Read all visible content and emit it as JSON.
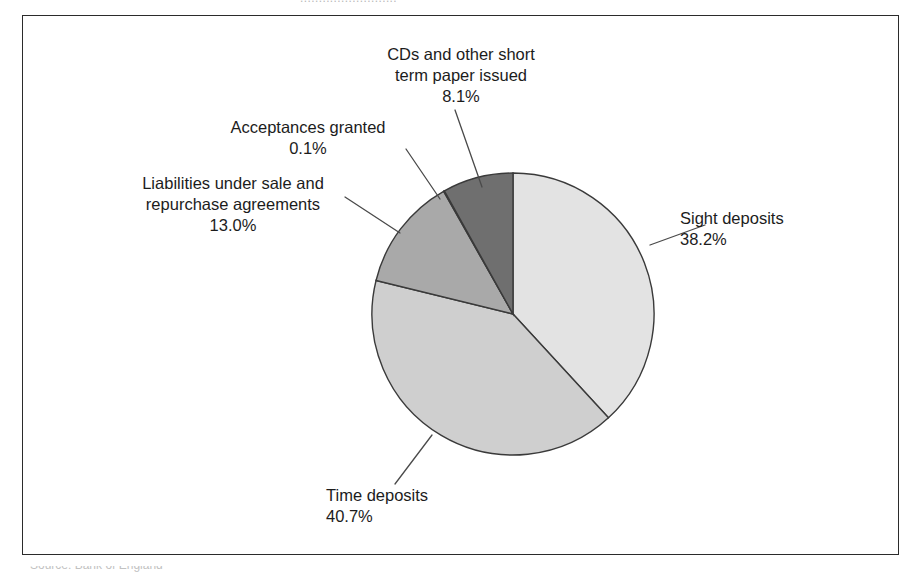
{
  "figure": {
    "top_clipped_caption": "..........................",
    "bottom_clipped_caption": "Source: Bank of England"
  },
  "chart_data": {
    "type": "pie",
    "title": "",
    "subtitle": "",
    "xlabel": "",
    "ylabel": "",
    "legend_position": "callout-labels",
    "grid": false,
    "units": "percent",
    "total": 100.1,
    "start_angle_deg": 0,
    "direction": "clockwise",
    "categories": [
      "Sight deposits",
      "Time deposits",
      "Liabilities under sale and repurchase agreements",
      "Acceptances granted",
      "CDs and other short term paper issued"
    ],
    "values": [
      38.2,
      40.7,
      13.0,
      0.1,
      8.1
    ],
    "value_labels": [
      "38.2%",
      "40.7%",
      "13.0%",
      "0.1%",
      "8.1%"
    ],
    "colors": [
      "#e3e3e3",
      "#cfcfcf",
      "#a9a9a9",
      "#bdbdbd",
      "#6f6f6f"
    ],
    "slices": [
      {
        "name": "Sight deposits",
        "value": 38.2,
        "value_label": "38.2%",
        "color": "#e3e3e3",
        "label_lines": [
          "Sight deposits",
          "38.2%"
        ]
      },
      {
        "name": "Time deposits",
        "value": 40.7,
        "value_label": "40.7%",
        "color": "#cfcfcf",
        "label_lines": [
          "Time deposits",
          "40.7%"
        ]
      },
      {
        "name": "Liabilities under sale and repurchase agreements",
        "value": 13.0,
        "value_label": "13.0%",
        "color": "#a9a9a9",
        "label_lines": [
          "Liabilities under sale and",
          "repurchase agreements",
          "13.0%"
        ]
      },
      {
        "name": "Acceptances granted",
        "value": 0.1,
        "value_label": "0.1%",
        "color": "#bdbdbd",
        "label_lines": [
          "Acceptances granted",
          "0.1%"
        ]
      },
      {
        "name": "CDs and other short term paper issued",
        "value": 8.1,
        "value_label": "8.1%",
        "color": "#6f6f6f",
        "label_lines": [
          "CDs and other short",
          "term paper issued",
          "8.1%"
        ]
      }
    ]
  },
  "labels": {
    "cds": {
      "line1": "CDs and other short",
      "line2": "term paper issued",
      "line3": "8.1%"
    },
    "acceptances": {
      "line1": "Acceptances granted",
      "line2": "0.1%"
    },
    "liabilities": {
      "line1": "Liabilities under sale and",
      "line2": "repurchase agreements",
      "line3": "13.0%"
    },
    "sight": {
      "line1": "Sight deposits",
      "line2": "38.2%"
    },
    "time": {
      "line1": "Time deposits",
      "line2": "40.7%"
    }
  },
  "colors": {
    "frame_border": "#2b2b2b",
    "slice_outline": "#3a3a3a",
    "leader_line": "#4a4a4a",
    "text": "#1c1c1c",
    "background": "#ffffff"
  }
}
